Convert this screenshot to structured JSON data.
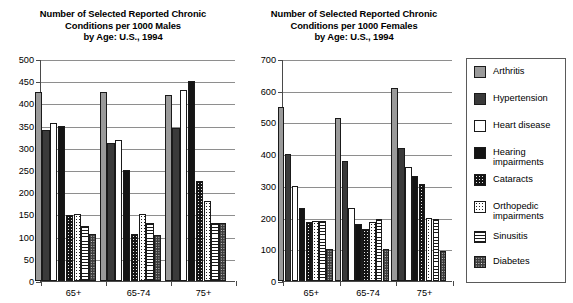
{
  "chart_data": [
    {
      "type": "bar",
      "id": "males",
      "title": [
        "Number of Selected Reported Chronic",
        "Conditions per 1000 Males",
        "by Age: U.S., 1994"
      ],
      "title_text": "Number of Selected Reported Chronic Conditions per 1000 Males by Age: U.S., 1994",
      "xlabel": "",
      "ylabel": "",
      "ylim": [
        0,
        500
      ],
      "yticks": [
        0,
        50,
        100,
        150,
        200,
        250,
        300,
        350,
        400,
        450,
        500
      ],
      "ytick_labels": [
        "0",
        "50",
        "100",
        "150",
        "200",
        "250",
        "300",
        "350",
        "400",
        "450",
        "500"
      ],
      "grid": true,
      "categories": [
        "65+",
        "65-74",
        "75+"
      ],
      "series": [
        {
          "name": "Arthritis",
          "key": "arthritis",
          "values": [
            425,
            425,
            420
          ]
        },
        {
          "name": "Hypertension",
          "key": "hypertension",
          "values": [
            340,
            310,
            345
          ]
        },
        {
          "name": "Heart disease",
          "key": "heart",
          "values": [
            355,
            318,
            430
          ]
        },
        {
          "name": "Hearing impairments",
          "key": "hearing",
          "values": [
            350,
            250,
            450
          ]
        },
        {
          "name": "Cataracts",
          "key": "cataracts",
          "values": [
            148,
            105,
            225
          ]
        },
        {
          "name": "Orthopedic impairments",
          "key": "orthopedic",
          "values": [
            150,
            152,
            180
          ]
        },
        {
          "name": "Sinusitis",
          "key": "sinusitis",
          "values": [
            125,
            130,
            130
          ]
        },
        {
          "name": "Diabetes",
          "key": "diabetes",
          "values": [
            105,
            103,
            130
          ]
        }
      ]
    },
    {
      "type": "bar",
      "id": "females",
      "title": [
        "Number of Selected Reported Chronic",
        "Conditions per 1000 Females",
        "by Age: U.S., 1994"
      ],
      "title_text": "Number of Selected Reported Chronic Conditions per 1000 Females by Age: U.S., 1994",
      "xlabel": "",
      "ylabel": "",
      "ylim": [
        0,
        700
      ],
      "yticks": [
        0,
        100,
        200,
        300,
        400,
        500,
        600,
        700
      ],
      "ytick_labels": [
        "0",
        "100",
        "200",
        "300",
        "400",
        "500",
        "600",
        "700"
      ],
      "grid": true,
      "categories": [
        "65+",
        "65-74",
        "75+"
      ],
      "series": [
        {
          "name": "Arthritis",
          "key": "arthritis",
          "values": [
            550,
            515,
            610
          ]
        },
        {
          "name": "Hypertension",
          "key": "hypertension",
          "values": [
            400,
            380,
            420
          ]
        },
        {
          "name": "Heart disease",
          "key": "heart",
          "values": [
            300,
            230,
            360
          ]
        },
        {
          "name": "Hearing impairments",
          "key": "hearing",
          "values": [
            230,
            180,
            330
          ]
        },
        {
          "name": "Cataracts",
          "key": "cataracts",
          "values": [
            185,
            165,
            305
          ]
        },
        {
          "name": "Orthopedic impairments",
          "key": "orthopedic",
          "values": [
            190,
            185,
            200
          ]
        },
        {
          "name": "Sinusitis",
          "key": "sinusitis",
          "values": [
            190,
            195,
            195
          ]
        },
        {
          "name": "Diabetes",
          "key": "diabetes",
          "values": [
            100,
            100,
            95
          ]
        }
      ]
    }
  ],
  "legend": {
    "position": "right",
    "items": [
      {
        "label": "Arthritis",
        "key": "arthritis",
        "color": "#9a9a9a",
        "pattern": "solid-gray"
      },
      {
        "label": "Hypertension",
        "key": "hypertension",
        "color": "#3a3a3a",
        "pattern": "solid-dark-gray"
      },
      {
        "label": "Heart disease",
        "key": "heart",
        "color": "#ffffff",
        "pattern": "solid-white"
      },
      {
        "label": "Hearing impairments",
        "key": "hearing",
        "color": "#141414",
        "pattern": "solid-black"
      },
      {
        "label": "Cataracts",
        "key": "cataracts",
        "color": "#141414",
        "pattern": "black-speckled"
      },
      {
        "label": "Orthopedic impairments",
        "key": "orthopedic",
        "color": "#ffffff",
        "pattern": "white-dotted"
      },
      {
        "label": "Sinusitis",
        "key": "sinusitis",
        "color": "#ffffff",
        "pattern": "horizontal-lines"
      },
      {
        "label": "Diabetes",
        "key": "diabetes",
        "color": "#3d3d3d",
        "pattern": "dark-speckled"
      }
    ]
  }
}
